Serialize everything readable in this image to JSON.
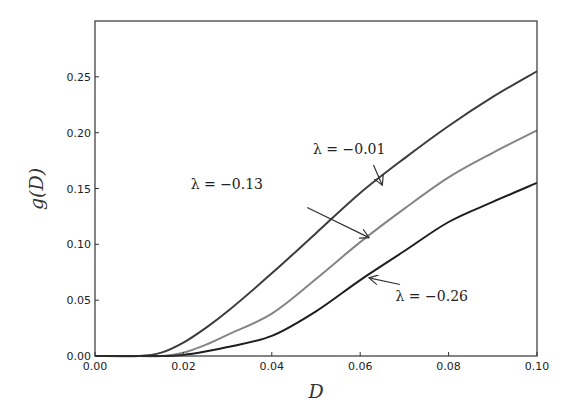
{
  "chart_data": {
    "type": "line",
    "title": "",
    "xlabel": "D",
    "ylabel": "g(D)",
    "xlim": [
      0.0,
      0.1
    ],
    "ylim": [
      0.0,
      0.3
    ],
    "grid": false,
    "legend": "none (inline annotations with arrows)",
    "xticks": [
      "0.00",
      "0.02",
      "0.04",
      "0.06",
      "0.08",
      "0.10"
    ],
    "yticks": [
      "0.00",
      "0.05",
      "0.10",
      "0.15",
      "0.20",
      "0.25"
    ],
    "x": [
      0.0,
      0.01,
      0.015,
      0.02,
      0.025,
      0.03,
      0.04,
      0.05,
      0.06,
      0.07,
      0.08,
      0.09,
      0.1
    ],
    "series": [
      {
        "name": "λ = −0.01",
        "color": "#3c3c3c",
        "values": [
          0.0,
          0.0,
          0.003,
          0.012,
          0.025,
          0.04,
          0.074,
          0.11,
          0.146,
          0.177,
          0.206,
          0.232,
          0.255
        ]
      },
      {
        "name": "λ = −0.13",
        "color": "#858585",
        "values": [
          0.0,
          0.0,
          0.0,
          0.003,
          0.01,
          0.019,
          0.038,
          0.069,
          0.102,
          0.132,
          0.16,
          0.182,
          0.202
        ]
      },
      {
        "name": "λ = −0.26",
        "color": "#1e1e1e",
        "values": [
          0.0,
          0.0,
          0.0,
          0.001,
          0.004,
          0.008,
          0.018,
          0.04,
          0.068,
          0.094,
          0.12,
          0.138,
          0.155
        ]
      }
    ],
    "annotations": [
      {
        "text": "λ = −0.01",
        "xy": [
          0.065,
          0.153
        ],
        "xytext": [
          0.062,
          0.177
        ]
      },
      {
        "text": "λ = −0.13",
        "xy": [
          0.062,
          0.106
        ],
        "xytext": [
          0.042,
          0.148
        ]
      },
      {
        "text": "λ = −0.26",
        "xy": [
          0.062,
          0.07
        ],
        "xytext": [
          0.068,
          0.055
        ]
      }
    ]
  }
}
